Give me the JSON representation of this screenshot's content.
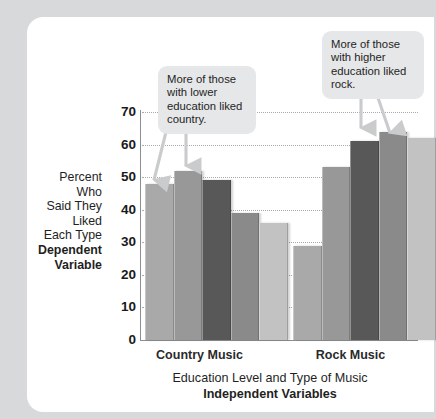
{
  "chart_data": {
    "type": "bar",
    "title": "",
    "subtitle": "",
    "xlabel": "Education Level and Type of Music",
    "xlabel_bold": "Independent Variables",
    "ylabel_lines": [
      "Percent",
      "Who",
      "Said They",
      "Liked",
      "Each Type"
    ],
    "ylabel_bold_lines": [
      "Dependent",
      "Variable"
    ],
    "ylim": [
      0,
      70
    ],
    "ytick_values": [
      0,
      10,
      20,
      30,
      40,
      50,
      60,
      70
    ],
    "ytick_labels": [
      "0",
      "10",
      "20",
      "30",
      "40",
      "50",
      "60",
      "70"
    ],
    "grid": true,
    "legend": "none",
    "categories": [
      "Country Music",
      "Rock Music"
    ],
    "series": [
      {
        "name": "Education level 1 (lowest)",
        "values": [
          48,
          29
        ],
        "color": "#a9a9a9"
      },
      {
        "name": "Education level 2",
        "values": [
          52,
          53
        ],
        "color": "#989898"
      },
      {
        "name": "Education level 3",
        "values": [
          49,
          61
        ],
        "color": "#585858"
      },
      {
        "name": "Education level 4",
        "values": [
          39,
          64
        ],
        "color": "#8a8a8a"
      },
      {
        "name": "Education level 5 (highest)",
        "values": [
          36,
          62
        ],
        "color": "#c2c2c2"
      }
    ],
    "bars": [
      {
        "group": "Country Music",
        "index": 0,
        "value": 48,
        "color": "#a9a9a9"
      },
      {
        "group": "Country Music",
        "index": 1,
        "value": 52,
        "color": "#989898"
      },
      {
        "group": "Country Music",
        "index": 2,
        "value": 49,
        "color": "#585858"
      },
      {
        "group": "Country Music",
        "index": 3,
        "value": 39,
        "color": "#8a8a8a"
      },
      {
        "group": "Country Music",
        "index": 4,
        "value": 36,
        "color": "#c2c2c2"
      },
      {
        "group": "Rock Music",
        "index": 0,
        "value": 29,
        "color": "#a9a9a9"
      },
      {
        "group": "Rock Music",
        "index": 1,
        "value": 53,
        "color": "#989898"
      },
      {
        "group": "Rock Music",
        "index": 2,
        "value": 61,
        "color": "#585858"
      },
      {
        "group": "Rock Music",
        "index": 3,
        "value": 64,
        "color": "#8a8a8a"
      },
      {
        "group": "Rock Music",
        "index": 4,
        "value": 62,
        "color": "#c2c2c2"
      }
    ],
    "annotations": [
      {
        "id": "callout-left",
        "text": "More of those with lower education liked country.",
        "points_to": [
          "Country Music bar 1",
          "Country Music bar 2"
        ]
      },
      {
        "id": "callout-right",
        "text": "More of those with higher education liked rock.",
        "points_to": [
          "Rock Music bar 4",
          "Rock Music bar 5"
        ]
      }
    ]
  },
  "axis": {
    "ytick_labels": [
      "70",
      "60",
      "50",
      "40",
      "30",
      "20",
      "10",
      "0"
    ],
    "category_labels": [
      "Country Music",
      "Rock Music"
    ]
  },
  "ylabel": {
    "line1": "Percent",
    "line2": "Who",
    "line3": "Said They",
    "line4": "Liked",
    "line5": "Each Type",
    "bold1": "Dependent",
    "bold2": "Variable"
  },
  "xlabel": {
    "line1": "Education Level and Type of Music",
    "bold1": "Independent Variables"
  },
  "callouts": {
    "left": {
      "line1": "More of those",
      "line2": "with lower",
      "line3": "education liked",
      "line4": "country."
    },
    "right": {
      "line1": "More of those",
      "line2": "with higher",
      "line3": "education liked",
      "line4": "rock."
    }
  },
  "colors": {
    "page_background": "#d7d9da",
    "panel_background": "#ffffff",
    "callout_background": "#e6e7e8",
    "axis": "#8c8f91",
    "gridline": "#a8abad",
    "arrow": "#c9cbcc",
    "text": "#1f1f1f"
  }
}
